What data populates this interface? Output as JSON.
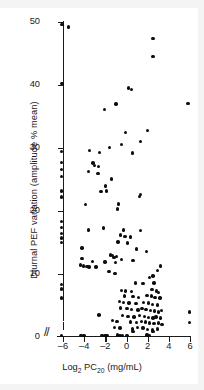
{
  "chart_data": {
    "type": "scatter",
    "title": "",
    "xlabel": "Log2 PC20 (mg/mL)",
    "xlabel_parts": {
      "base": "Log",
      "sub1": "2",
      "mid": " PC",
      "sub2": "20",
      "tail": " (mg/mL)"
    },
    "ylabel": "Diurnal PEF variation (amplitude % mean)",
    "xlim": [
      -7.0,
      6.6
    ],
    "ylim": [
      0,
      50
    ],
    "xticks": [
      -6,
      -4,
      -2,
      0,
      2,
      4,
      6
    ],
    "xtick_labels": [
      "–6",
      "–4",
      "–2",
      "0",
      "2",
      "4",
      "6"
    ],
    "yticks": [
      0,
      10,
      20,
      30,
      40,
      50
    ],
    "ytick_labels": [
      "0",
      "10",
      "20",
      "30",
      "40",
      "50"
    ],
    "grid": false,
    "legend": null,
    "axis_break": "//",
    "marker": {
      "shape": "circle",
      "color": "#0d0d0d",
      "size": 3.4
    },
    "n_points": 152,
    "points": [
      [
        -6.1,
        49.6
      ],
      [
        -5.5,
        49.2
      ],
      [
        2.5,
        47.4
      ],
      [
        2.5,
        44.5
      ],
      [
        -6.1,
        40.2
      ],
      [
        0.2,
        39.5
      ],
      [
        0.45,
        39.3
      ],
      [
        5.8,
        37.1
      ],
      [
        -1.0,
        37.0
      ],
      [
        -2.1,
        36.1
      ],
      [
        2.0,
        32.8
      ],
      [
        -0.1,
        32.5
      ],
      [
        1.35,
        31.0
      ],
      [
        -0.45,
        30.6
      ],
      [
        -1.6,
        30.1
      ],
      [
        -3.5,
        29.6
      ],
      [
        -6.15,
        29.4
      ],
      [
        -2.55,
        29.3
      ],
      [
        0.55,
        29.2
      ],
      [
        -6.15,
        27.7
      ],
      [
        -3.15,
        27.6
      ],
      [
        -3.0,
        27.2
      ],
      [
        -2.65,
        27.1
      ],
      [
        -6.15,
        26.6
      ],
      [
        -3.6,
        26.3
      ],
      [
        -2.7,
        26.0
      ],
      [
        -6.15,
        25.5
      ],
      [
        -1.4,
        25.1
      ],
      [
        -2.0,
        24.0
      ],
      [
        -6.15,
        23.2
      ],
      [
        -1.9,
        23.2
      ],
      [
        -2.4,
        23.1
      ],
      [
        -6.15,
        22.2
      ],
      [
        1.3,
        22.6
      ],
      [
        1.25,
        22.3
      ],
      [
        -3.9,
        21.0
      ],
      [
        -0.75,
        21.1
      ],
      [
        -0.85,
        20.3
      ],
      [
        -6.15,
        18.3
      ],
      [
        -6.15,
        17.4
      ],
      [
        -2.2,
        17.3
      ],
      [
        -3.6,
        17.0
      ],
      [
        -0.3,
        17.0
      ],
      [
        1.3,
        16.9
      ],
      [
        -6.15,
        16.4
      ],
      [
        -0.55,
        16.2
      ],
      [
        -0.15,
        16.0
      ],
      [
        0.35,
        15.9
      ],
      [
        -6.15,
        15.7
      ],
      [
        -6.15,
        15.0
      ],
      [
        -0.8,
        15.1
      ],
      [
        0.1,
        14.9
      ],
      [
        -4.2,
        14.1
      ],
      [
        0.95,
        14.0
      ],
      [
        1.9,
        13.6
      ],
      [
        -1.5,
        13.0
      ],
      [
        -1.35,
        12.9
      ],
      [
        -0.95,
        12.8
      ],
      [
        -1.2,
        12.6
      ],
      [
        -4.2,
        12.5
      ],
      [
        -0.45,
        12.3
      ],
      [
        0.6,
        12.1
      ],
      [
        -3.2,
        12.0
      ],
      [
        -2.05,
        11.9
      ],
      [
        -1.05,
        11.8
      ],
      [
        -4.35,
        11.4
      ],
      [
        -4.05,
        11.3
      ],
      [
        -3.75,
        11.2
      ],
      [
        -3.55,
        11.1
      ],
      [
        -2.9,
        11.1
      ],
      [
        3.2,
        11.3
      ],
      [
        2.95,
        10.6
      ],
      [
        -1.65,
        10.4
      ],
      [
        -1.1,
        10.1
      ],
      [
        2.5,
        9.7
      ],
      [
        2.15,
        9.4
      ],
      [
        -6.15,
        8.3
      ],
      [
        0.85,
        8.6
      ],
      [
        1.55,
        8.5
      ],
      [
        2.6,
        8.6
      ],
      [
        -6.15,
        7.6
      ],
      [
        -0.45,
        7.4
      ],
      [
        -0.1,
        7.3
      ],
      [
        0.5,
        7.2
      ],
      [
        2.4,
        7.5
      ],
      [
        2.85,
        7.3
      ],
      [
        3.05,
        7.1
      ],
      [
        -6.15,
        6.2
      ],
      [
        -0.2,
        6.5
      ],
      [
        0.6,
        6.4
      ],
      [
        1.15,
        6.3
      ],
      [
        1.95,
        6.6
      ],
      [
        2.35,
        6.5
      ],
      [
        2.7,
        6.3
      ],
      [
        3.15,
        6.2
      ],
      [
        -0.65,
        5.6
      ],
      [
        -0.3,
        5.5
      ],
      [
        0.25,
        5.4
      ],
      [
        0.9,
        5.3
      ],
      [
        1.6,
        5.5
      ],
      [
        2.05,
        5.4
      ],
      [
        2.45,
        5.2
      ],
      [
        2.9,
        5.1
      ],
      [
        -0.55,
        4.6
      ],
      [
        0.05,
        4.5
      ],
      [
        0.45,
        4.4
      ],
      [
        1.1,
        4.3
      ],
      [
        1.45,
        4.5
      ],
      [
        1.85,
        4.4
      ],
      [
        2.25,
        4.2
      ],
      [
        2.65,
        4.1
      ],
      [
        3.0,
        4.0
      ],
      [
        3.3,
        4.2
      ],
      [
        5.95,
        4.0
      ],
      [
        -2.6,
        3.5
      ],
      [
        -0.4,
        3.4
      ],
      [
        0.15,
        3.3
      ],
      [
        0.7,
        3.2
      ],
      [
        1.25,
        3.4
      ],
      [
        1.7,
        3.3
      ],
      [
        2.1,
        3.1
      ],
      [
        2.5,
        3.0
      ],
      [
        2.8,
        3.2
      ],
      [
        3.2,
        3.0
      ],
      [
        5.95,
        2.3
      ],
      [
        -1.3,
        2.6
      ],
      [
        -0.9,
        2.5
      ],
      [
        0.35,
        2.4
      ],
      [
        0.95,
        2.3
      ],
      [
        1.4,
        2.5
      ],
      [
        1.8,
        2.4
      ],
      [
        2.2,
        2.2
      ],
      [
        2.6,
        2.1
      ],
      [
        3.05,
        2.2
      ],
      [
        3.35,
        2.0
      ],
      [
        -1.15,
        1.5
      ],
      [
        -0.6,
        1.4
      ],
      [
        0.55,
        1.3
      ],
      [
        1.05,
        1.5
      ],
      [
        1.55,
        1.4
      ],
      [
        2.0,
        1.2
      ],
      [
        2.45,
        1.1
      ],
      [
        2.95,
        1.3
      ],
      [
        -6.15,
        0.25
      ],
      [
        -4.3,
        0.2
      ],
      [
        -4.0,
        0.2
      ],
      [
        -2.3,
        0.25
      ],
      [
        -2.05,
        0.2
      ],
      [
        -1.85,
        0.2
      ],
      [
        -0.85,
        0.3
      ],
      [
        -0.6,
        0.25
      ],
      [
        -0.35,
        0.2
      ],
      [
        0.05,
        0.2
      ],
      [
        0.6,
        0.9
      ],
      [
        1.95,
        0.3
      ],
      [
        2.15,
        0.25
      ],
      [
        2.5,
        0.9
      ]
    ]
  }
}
